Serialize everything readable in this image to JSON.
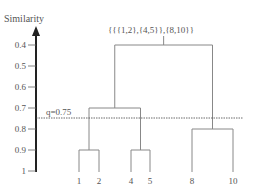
{
  "diagram": {
    "type": "dendrogram",
    "axis_title": "Similarity",
    "ticks": [
      "0.4",
      "0.5",
      "0.6",
      "0.7",
      "0.8",
      "0.9",
      "1"
    ],
    "threshold_label": "q=0.75",
    "root_label": "{{{1,2},{4,5}},{8,10}}",
    "leaves": [
      "1",
      "2",
      "4",
      "5",
      "8",
      "10"
    ],
    "merges": [
      {
        "cluster": "{1,2}",
        "similarity": 0.9
      },
      {
        "cluster": "{4,5}",
        "similarity": 0.9
      },
      {
        "cluster": "{{1,2},{4,5}}",
        "similarity": 0.7
      },
      {
        "cluster": "{8,10}",
        "similarity": 0.8
      },
      {
        "cluster": "{{{1,2},{4,5}},{8,10}}",
        "similarity": 0.4
      }
    ],
    "threshold": 0.75,
    "colors": {
      "line": "#888888",
      "axis": "#222222",
      "text": "#555555"
    }
  }
}
